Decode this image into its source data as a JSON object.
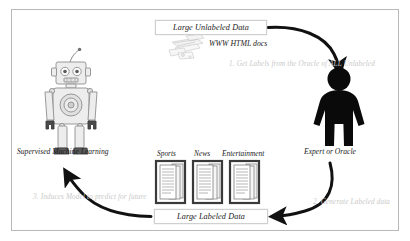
{
  "diagram": {
    "title_nodes": {
      "unlabeled_data": "Large Unlabeled Data",
      "labeled_data": "Large Labeled Data"
    },
    "figures": [
      {
        "id": "robot",
        "icon": "robot-icon",
        "caption": "Supervised Machine Learning"
      },
      {
        "id": "expert",
        "icon": "person-silhouette-icon",
        "caption": "Expert or Oracle"
      }
    ],
    "source_icon": {
      "icon": "scattered-web-documents-icon",
      "caption": "WWW HTML docs"
    },
    "document_categories": [
      {
        "label": "Sports",
        "icon": "document-stack-icon"
      },
      {
        "label": "News",
        "icon": "document-stack-icon"
      },
      {
        "label": "Entertainment",
        "icon": "document-stack-icon"
      }
    ],
    "steps": [
      {
        "number": "1",
        "text": "1. Get Labels from the Oracle of ALL Unlabeled"
      },
      {
        "number": "2",
        "text": "2. Generate Labeled data"
      },
      {
        "number": "3",
        "text": "3. Induces Model to predict for future"
      }
    ],
    "arrows": [
      {
        "name": "unlabeled-to-expert-arrow",
        "from": "Large Unlabeled Data",
        "to": "Expert or Oracle"
      },
      {
        "name": "expert-to-labeled-arrow",
        "from": "Expert or Oracle",
        "to": "Large Labeled Data"
      },
      {
        "name": "labeled-to-model-arrow",
        "from": "Large Labeled Data",
        "to": "Supervised Machine Learning"
      }
    ],
    "colors": {
      "frame_border": "#b9b9b9",
      "arrow": "#1a1a1a",
      "note_text": "#c9c9c9",
      "robot_line": "#8c8c8c",
      "robot_fill": "#e8e8e8",
      "person_fill": "#0a0a0a",
      "document_border": "#3a3a3a",
      "background": "#ffffff"
    }
  }
}
